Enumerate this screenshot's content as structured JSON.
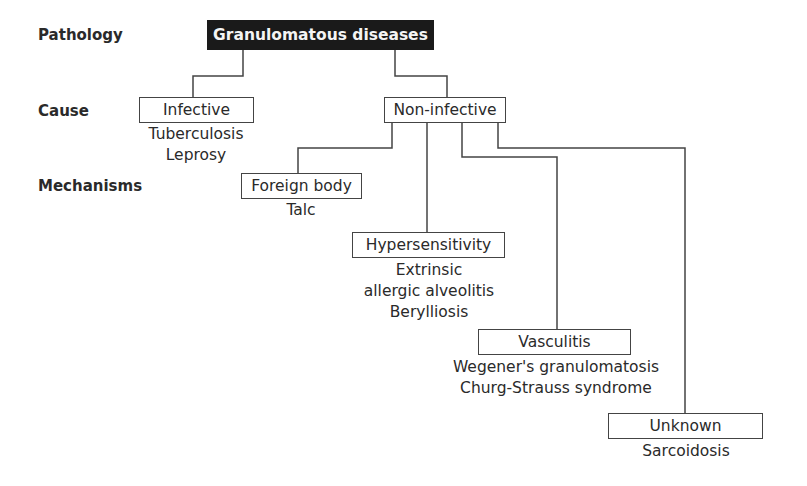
{
  "levels": {
    "pathology": "Pathology",
    "cause": "Cause",
    "mechanisms": "Mechanisms"
  },
  "root": {
    "label": "Granulomatous diseases"
  },
  "causes": [
    {
      "label": "Infective",
      "examples": [
        "Tuberculosis",
        "Leprosy"
      ]
    },
    {
      "label": "Non-infective",
      "examples": []
    }
  ],
  "mechanisms": [
    {
      "label": "Foreign body",
      "examples": [
        "Talc"
      ]
    },
    {
      "label": "Hypersensitivity",
      "examples": [
        "Extrinsic",
        "allergic alveolitis",
        "Berylliosis"
      ]
    },
    {
      "label": "Vasculitis",
      "examples": [
        "Wegener's granulomatosis",
        "Churg-Strauss syndrome"
      ]
    },
    {
      "label": "Unknown",
      "examples": [
        "Sarcoidosis"
      ]
    }
  ],
  "colors": {
    "root_bg": "#1a1a1a",
    "root_text": "#f4f4f4",
    "line": "#444444"
  }
}
